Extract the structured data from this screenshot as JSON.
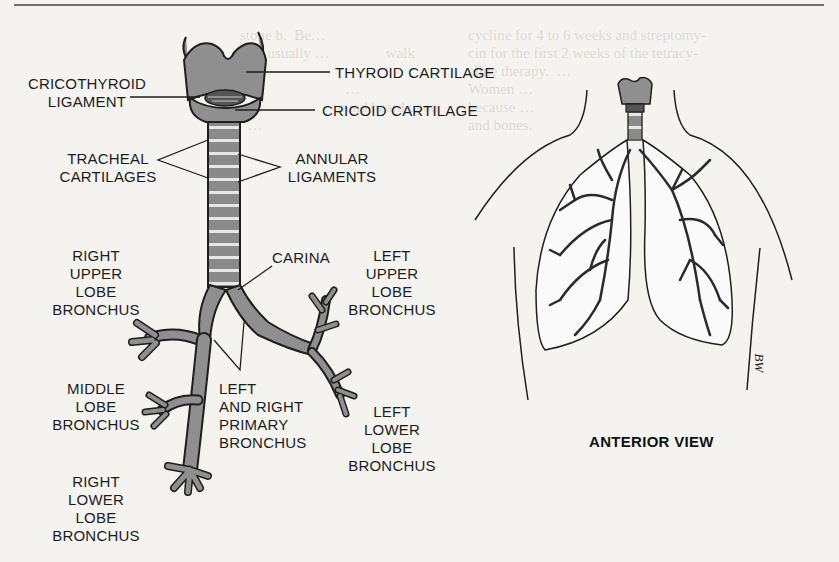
{
  "page": {
    "background_color": "#f4f3f0"
  },
  "left_figure": {
    "name": "Trachea and bronchial tree",
    "labels": {
      "thyroid_cartilage": "THYROID CARTILAGE",
      "cricothyroid_ligament": [
        "CRICOTHYROID",
        "LIGAMENT"
      ],
      "cricoid_cartilage": "CRICOID CARTILAGE",
      "tracheal_cartilages": [
        "TRACHEAL",
        "CARTILAGES"
      ],
      "annular_ligaments": [
        "ANNULAR",
        "LIGAMENTS"
      ],
      "carina": "CARINA",
      "right_upper_lobe_bronchus": [
        "RIGHT",
        "UPPER",
        "LOBE",
        "BRONCHUS"
      ],
      "left_upper_lobe_bronchus": [
        "LEFT",
        "UPPER",
        "LOBE",
        "BRONCHUS"
      ],
      "middle_lobe_bronchus": [
        "MIDDLE",
        "LOBE",
        "BRONCHUS"
      ],
      "primary_bronchus": [
        "LEFT",
        "AND RIGHT",
        "PRIMARY",
        "BRONCHUS"
      ],
      "left_lower_lobe_bronchus": [
        "LEFT",
        "LOWER",
        "LOBE",
        "BRONCHUS"
      ],
      "right_lower_lobe_bronchus": [
        "RIGHT",
        "LOWER",
        "LOBE",
        "BRONCHUS"
      ]
    },
    "colors": {
      "cartilage_fill": "#8f8f8f",
      "outline": "#1e1e1e"
    }
  },
  "right_figure": {
    "name": "Lungs in torso outline",
    "caption": "ANTERIOR VIEW",
    "artist_initials": "BW"
  }
}
